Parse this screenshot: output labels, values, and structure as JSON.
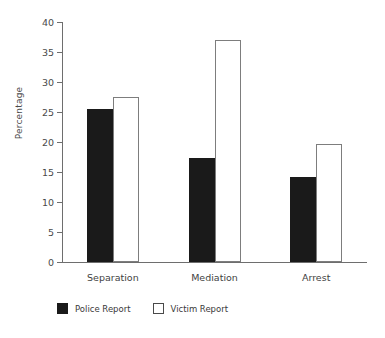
{
  "chart_data": {
    "type": "bar",
    "title": "",
    "subtitle": "",
    "xlabel": "",
    "ylabel": "Percentage",
    "categories": [
      "Separation",
      "Mediation",
      "Arrest"
    ],
    "series": [
      {
        "name": "Police Report",
        "values": [
          25.5,
          17.4,
          14.2
        ],
        "style": "filled",
        "color": "#1a1a1a"
      },
      {
        "name": "Victim Report",
        "values": [
          27.5,
          37.0,
          19.7
        ],
        "style": "outlined",
        "color": "#ffffff"
      }
    ],
    "ylim": [
      0,
      40
    ],
    "yticks": [
      0,
      5,
      10,
      15,
      20,
      25,
      30,
      35,
      40
    ],
    "ytick_labels": [
      "0",
      "5",
      "10",
      "15",
      "20",
      "25",
      "30",
      "35",
      "40"
    ],
    "grid": false,
    "legend_position": "bottom-left",
    "axis_color": "#6e6e6e",
    "bar_outline_color": "#7d7d7d"
  },
  "legend": {
    "items": [
      {
        "label": "Police Report",
        "style": "filled"
      },
      {
        "label": "Victim Report",
        "style": "outlined"
      }
    ]
  }
}
